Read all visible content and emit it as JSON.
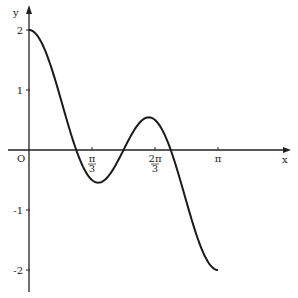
{
  "chart_data": {
    "type": "line",
    "title": "",
    "function": "y = cos x + cos 3x",
    "xlabel": "x",
    "ylabel": "y",
    "origin_label": "O",
    "xlim": [
      0,
      3.14159
    ],
    "ylim": [
      -2,
      2
    ],
    "x_ticks": [
      {
        "value": 1.0472,
        "label": "π/3",
        "num": "π",
        "den": "3"
      },
      {
        "value": 2.0944,
        "label": "2π/3",
        "num": "2π",
        "den": "3"
      },
      {
        "value": 3.14159,
        "label": "π",
        "num": "π",
        "den": ""
      }
    ],
    "y_ticks": [
      {
        "value": 2,
        "label": "2"
      },
      {
        "value": 1,
        "label": "1"
      },
      {
        "value": -1,
        "label": "-1"
      },
      {
        "value": -2,
        "label": "-2"
      }
    ],
    "series": [
      {
        "name": "y = cos x + cos 3x",
        "x": [
          0,
          0.2618,
          0.5236,
          0.7854,
          1.0472,
          1.309,
          1.5708,
          1.8326,
          2.0944,
          2.3562,
          2.618,
          2.8798,
          3.14159
        ],
        "values": [
          2,
          1.673,
          0.866,
          0.0,
          -0.5,
          -0.448,
          0.0,
          0.448,
          0.5,
          0.0,
          -0.866,
          -1.673,
          -2
        ]
      }
    ],
    "grid": false,
    "line_color": "#1a1a1a"
  }
}
